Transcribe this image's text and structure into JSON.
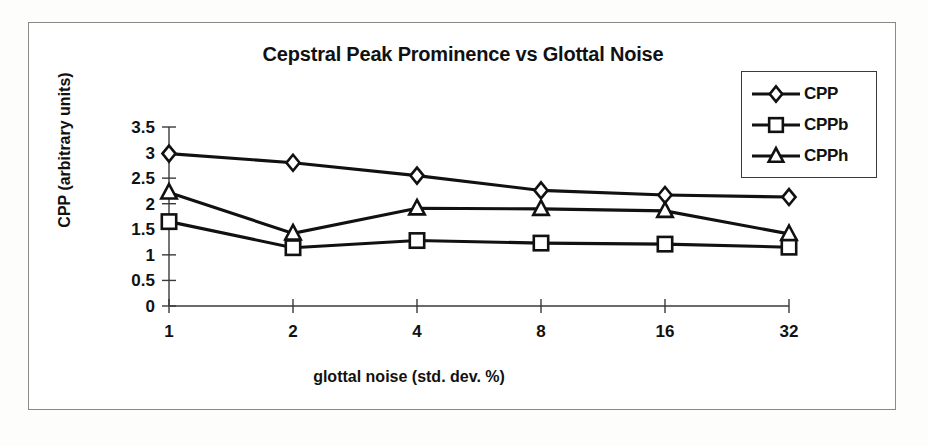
{
  "chart_data": {
    "type": "line",
    "title": "Cepstral Peak Prominence vs Glottal Noise",
    "xlabel": "glottal noise (std. dev.  %)",
    "ylabel": "CPP (arbitrary units)",
    "categories": [
      "1",
      "2",
      "4",
      "8",
      "16",
      "32"
    ],
    "yticks": [
      "0",
      "0.5",
      "1",
      "1.5",
      "2",
      "2.5",
      "3",
      "3.5"
    ],
    "ylim": [
      0,
      3.5
    ],
    "grid": false,
    "legend_position": "top-right",
    "series": [
      {
        "name": "CPP",
        "marker": "diamond",
        "values": [
          2.98,
          2.8,
          2.55,
          2.26,
          2.17,
          2.13
        ]
      },
      {
        "name": "CPPb",
        "marker": "square",
        "values": [
          1.65,
          1.14,
          1.28,
          1.23,
          1.21,
          1.15
        ]
      },
      {
        "name": "CPPh",
        "marker": "triangle",
        "values": [
          2.22,
          1.42,
          1.91,
          1.9,
          1.86,
          1.41
        ]
      }
    ]
  },
  "legend": {
    "items": [
      {
        "label": "CPP",
        "marker": "diamond"
      },
      {
        "label": "CPPb",
        "marker": "square"
      },
      {
        "label": "CPPh",
        "marker": "triangle"
      }
    ]
  }
}
